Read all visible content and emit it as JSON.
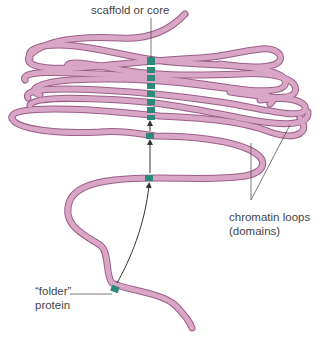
{
  "diagram": {
    "labels": {
      "scaffold": "scaffold or core",
      "loops_line1": "chromatin loops",
      "loops_line2": "(domains)",
      "folder_line1": "“folder”",
      "folder_line2": "protein"
    },
    "colors": {
      "fiber_fill": "#d9a6c6",
      "fiber_stroke": "#9a5f86",
      "scaffold": "#2e8a78",
      "leader_line": "#555555",
      "text": "#444444"
    },
    "elements": {
      "scaffold_segments": 8,
      "folder_protein_segments": 4,
      "arrows": 3
    }
  }
}
